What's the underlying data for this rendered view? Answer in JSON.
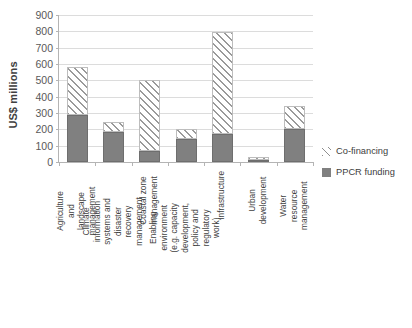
{
  "chart_data": {
    "type": "bar",
    "stacked": true,
    "title": "",
    "xlabel": "",
    "ylabel": "US$ millions",
    "ylim": [
      0,
      900
    ],
    "ytick_step": 100,
    "yticks": [
      0,
      100,
      200,
      300,
      400,
      500,
      600,
      700,
      800,
      900
    ],
    "grid": true,
    "legend_position": "right",
    "categories": [
      "Agriculture and landscape management",
      "Climate information systems and disaster recovery management",
      "Coastal zone management",
      "Enabling environment (e.g. capacity development, policy and regulatory work)",
      "Infrastructure",
      "Urban development",
      "Water resource management"
    ],
    "series": [
      {
        "name": "PPCR funding",
        "color": "#808080",
        "values": [
          285,
          185,
          70,
          140,
          170,
          15,
          200
        ]
      },
      {
        "name": "Co-financing",
        "color": "#9a9a9a",
        "pattern": "diagonal-hatch",
        "values": [
          295,
          60,
          435,
          60,
          625,
          15,
          145
        ]
      }
    ],
    "totals": [
      580,
      245,
      505,
      200,
      795,
      30,
      345
    ]
  },
  "axis": {
    "y_title": "US$ millions",
    "y_ticks": [
      "900",
      "800",
      "700",
      "600",
      "500",
      "400",
      "300",
      "200",
      "100",
      "0"
    ]
  },
  "legend": {
    "items": [
      {
        "label": "Co-financing",
        "key": "hatch-swatch"
      },
      {
        "label": "PPCR funding",
        "key": "solid-gray-swatch"
      }
    ]
  },
  "x_labels": [
    "Agriculture and landscape management",
    "Climate information systems and disaster recovery management",
    "Coastal zone management",
    "Enabling environment (e.g. capacity development, policy and regulatory work)",
    "Infrastructure",
    "Urban development",
    "Water resource management"
  ],
  "colors": {
    "ppcr_fill": "#808080",
    "cofinancing_hatch": "#9a9a9a",
    "gridline": "#dcdcdc",
    "axis_line": "#b4b4b4",
    "text": "#404040"
  }
}
